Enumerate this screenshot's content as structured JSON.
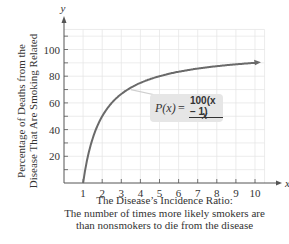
{
  "chart_data": {
    "type": "line",
    "title": "",
    "function": "P(x) = 100(x - 1)/x",
    "formula": {
      "lhs": "P(x)",
      "eq": "=",
      "numerator": "100(x − 1)",
      "denominator": "x"
    },
    "xlabel_lines": [
      "The Disease’s Incidence Ratio:",
      "The number of times more likely smokers are",
      "than nonsmokers to die from the disease"
    ],
    "ylabel_lines": [
      "Percentage of Deaths from the",
      "Disease That Are Smoking Related"
    ],
    "x_axis_name": "x",
    "y_axis_name": "y",
    "xlim": [
      0,
      10.5
    ],
    "ylim": [
      0,
      115
    ],
    "x_ticks": [
      1,
      2,
      3,
      4,
      5,
      6,
      7,
      8,
      9,
      10
    ],
    "x_tick_labels": [
      "1",
      "2",
      "3",
      "4",
      "5",
      "6",
      "7",
      "8",
      "9",
      "10"
    ],
    "y_ticks": [
      10,
      20,
      30,
      40,
      50,
      60,
      70,
      80,
      90,
      100,
      110
    ],
    "y_tick_labels": [
      "20",
      "40",
      "60",
      "80",
      "100"
    ],
    "y_labeled_values": [
      20,
      40,
      60,
      80,
      100
    ],
    "grid": true,
    "series": [
      {
        "name": "P(x)",
        "x": [
          1,
          1.25,
          1.5,
          2,
          2.5,
          3,
          4,
          5,
          6,
          7,
          8,
          9,
          10
        ],
        "y": [
          0,
          20,
          33.3,
          50,
          60,
          66.7,
          75,
          80,
          83.3,
          85.7,
          87.5,
          88.9,
          90
        ]
      }
    ],
    "colors": {
      "curve": "#6a6a6a",
      "grid": "#e4e4e4",
      "axis": "#555555",
      "formula_bg": "#e6e6e6"
    }
  }
}
